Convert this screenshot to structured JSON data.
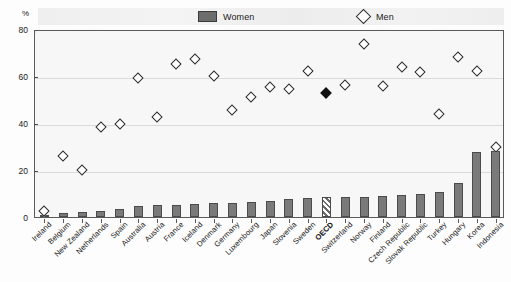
{
  "axis": {
    "y_unit_label": "%",
    "y_ticks": [
      "0",
      "20",
      "40",
      "60",
      "80"
    ],
    "y_min": 0,
    "y_max": 80
  },
  "legend": {
    "women_label": "Women",
    "men_label": "Men",
    "women_icon": "filled-square-swatch",
    "men_icon": "open-diamond-marker"
  },
  "colors": {
    "women_bar": "#7a7a7a",
    "women_bar_border": "#4b4b4b",
    "men_marker_fill": "#ffffff",
    "men_marker_border": "#2b2b2b",
    "oecd_marker_fill": "#111111",
    "plot_background": "#f7f7f7",
    "frame": "#5a5a5a"
  },
  "chart_data": {
    "type": "bar",
    "title": "",
    "xlabel": "",
    "ylabel": "%",
    "ylim": [
      0,
      80
    ],
    "grid": false,
    "legend_position": "top",
    "categories": [
      "Ireland",
      "Belgium",
      "New Zealand",
      "Netherlands",
      "Spain",
      "Australia",
      "Austria",
      "France",
      "Iceland",
      "Denmark",
      "Germany",
      "Luxembourg",
      "Japan",
      "Slovenia",
      "Sweden",
      "OECD",
      "Switzerland",
      "Norway",
      "Finland",
      "Czech Republic",
      "Slovak Republic",
      "Turkey",
      "Hungary",
      "Korea",
      "Indonesia"
    ],
    "highlight_category": "OECD",
    "series": [
      {
        "name": "Women",
        "type": "bar",
        "values": [
          0.5,
          1.5,
          2.0,
          2.5,
          3.5,
          4.5,
          5.0,
          5.0,
          5.5,
          6.0,
          6.0,
          6.5,
          7.0,
          7.5,
          8.0,
          8.5,
          8.5,
          8.5,
          9.0,
          9.5,
          10.0,
          10.5,
          14.5,
          27.5,
          28.0
        ]
      },
      {
        "name": "Men",
        "type": "scatter",
        "values": [
          3.5,
          27.0,
          21.0,
          39.0,
          40.5,
          60.0,
          43.5,
          66.0,
          68.0,
          61.0,
          46.5,
          52.0,
          56.0,
          55.5,
          63.0,
          53.5,
          57.0,
          74.5,
          56.5,
          64.5,
          62.5,
          44.5,
          69.0,
          63.0,
          30.5
        ]
      }
    ]
  }
}
